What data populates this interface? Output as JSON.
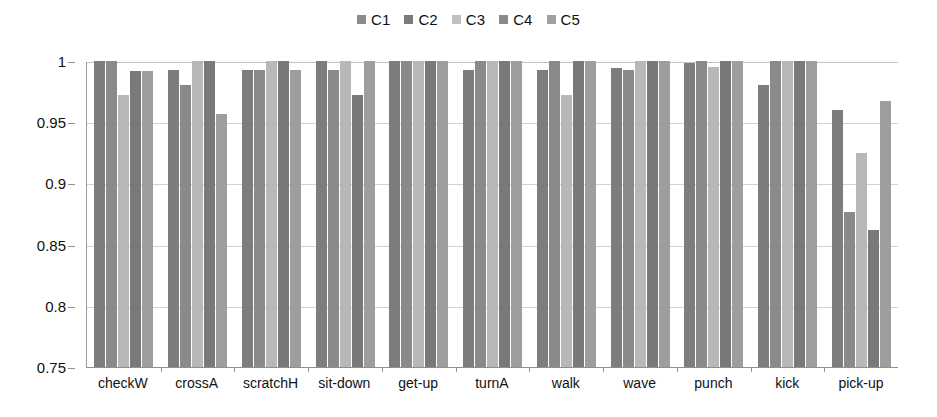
{
  "chart_data": {
    "type": "bar",
    "title": "",
    "subtitle": "",
    "xlabel": "",
    "ylabel": "",
    "ylim": [
      0.75,
      1
    ],
    "ytick_values": [
      1,
      0.95,
      0.9,
      0.85,
      0.8,
      0.75
    ],
    "ytick_labels": [
      "1",
      "0.95",
      "0.9",
      "0.85",
      "0.8",
      "0.75"
    ],
    "grid": true,
    "grid_axis": "y",
    "legend_position": "top-center",
    "categories": [
      "checkW",
      "crossA",
      "scratchH",
      "sit-down",
      "get-up",
      "turnA",
      "walk",
      "wave",
      "punch",
      "kick",
      "pick-up"
    ],
    "series": [
      {
        "name": "C1",
        "color": "#7d7d7d",
        "values": [
          1.0,
          0.993,
          0.993,
          1.0,
          1.0,
          0.993,
          0.993,
          0.994,
          0.998,
          0.98,
          0.96
        ]
      },
      {
        "name": "C2",
        "color": "#8a8a8a",
        "values": [
          1.0,
          0.98,
          0.993,
          0.993,
          1.0,
          1.0,
          1.0,
          0.993,
          1.0,
          1.0,
          0.877
        ]
      },
      {
        "name": "C3",
        "color": "#b8b8b8",
        "values": [
          0.972,
          1.0,
          1.0,
          1.0,
          1.0,
          1.0,
          0.972,
          1.0,
          0.995,
          1.0,
          0.925
        ]
      },
      {
        "name": "C4",
        "color": "#797979",
        "values": [
          0.992,
          1.0,
          1.0,
          0.972,
          1.0,
          1.0,
          1.0,
          1.0,
          1.0,
          1.0,
          0.862
        ]
      },
      {
        "name": "C5",
        "color": "#9e9e9e",
        "values": [
          0.992,
          0.957,
          0.993,
          1.0,
          1.0,
          1.0,
          1.0,
          1.0,
          1.0,
          1.0,
          0.967
        ]
      }
    ]
  },
  "legend": {
    "items": [
      {
        "label": "C1",
        "color": "#8c8c8c"
      },
      {
        "label": "C2",
        "color": "#7b7b7b"
      },
      {
        "label": "C3",
        "color": "#c0c0c0"
      },
      {
        "label": "C4",
        "color": "#8a8a8a"
      },
      {
        "label": "C5",
        "color": "#a0a0a0"
      }
    ]
  }
}
